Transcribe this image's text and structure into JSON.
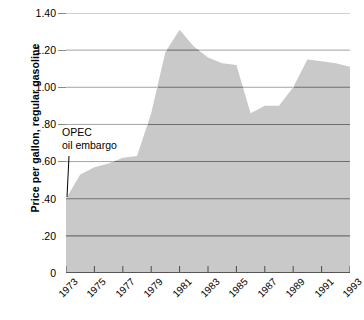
{
  "chart_data": {
    "type": "area",
    "title": "",
    "xlabel": "",
    "ylabel": "Price per gallon, regular gasoline",
    "ylim": [
      0,
      1.4
    ],
    "xlim": [
      1973,
      1993
    ],
    "grid": true,
    "legend": "none",
    "fill_color": "#c9c9c9",
    "gridline_color": "#6f6f6f",
    "y_ticks": [
      "1.40",
      "1.20",
      "1.00",
      ".80",
      ".60",
      ".40",
      ".20",
      "0"
    ],
    "y_tick_values": [
      1.4,
      1.2,
      1.0,
      0.8,
      0.6,
      0.4,
      0.2,
      0
    ],
    "x_ticks": [
      "1973",
      "1975",
      "1977",
      "1979",
      "1981",
      "1983",
      "1985",
      "1987",
      "1989",
      "1991",
      "1993"
    ],
    "x_tick_values": [
      1973,
      1975,
      1977,
      1979,
      1981,
      1983,
      1985,
      1987,
      1989,
      1991,
      1993
    ],
    "x": [
      1973,
      1974,
      1975,
      1976,
      1977,
      1978,
      1979,
      1980,
      1981,
      1982,
      1983,
      1984,
      1985,
      1986,
      1987,
      1988,
      1989,
      1990,
      1991,
      1992,
      1993
    ],
    "values": [
      0.4,
      0.53,
      0.57,
      0.59,
      0.62,
      0.63,
      0.86,
      1.19,
      1.31,
      1.22,
      1.16,
      1.13,
      1.12,
      0.86,
      0.9,
      0.9,
      1.0,
      1.15,
      1.14,
      1.13,
      1.11
    ],
    "annotations": [
      {
        "name": "opec-oil-embargo",
        "line1": "OPEC",
        "line2": "oil embargo",
        "points_to_year": 1973,
        "points_to_value": 0.4
      }
    ]
  }
}
